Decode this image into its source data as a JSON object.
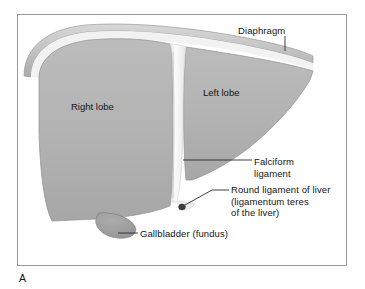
{
  "figure": {
    "panel_letter": "A",
    "title_alt": "Anterior view of the liver",
    "frame": {
      "x": 17,
      "y": 14,
      "width": 330,
      "height": 252,
      "border_color": "#9a9a9a",
      "background": "#ffffff"
    }
  },
  "colors": {
    "page_background": "#ffffff",
    "liver_parenchyma": "#b0b0b0",
    "liver_parenchyma_light": "#bdbdbd",
    "liver_outline": "#8a8a8a",
    "diaphragm_band": "#c9c9c9",
    "diaphragm_band_dark": "#a9a9a9",
    "diaphragm_highlight": "#efefef",
    "falciform_ligament": "#f4f4f4",
    "falciform_shadow": "#d8d8d8",
    "round_ligament": "#3d3d3d",
    "gallbladder": "#9e9e9e",
    "gallbladder_outline": "#7d7d7d",
    "leader_line": "#2b2b2b",
    "text": "#141414"
  },
  "annotations": [
    {
      "id": "diaphragm",
      "label": "Diaphragm",
      "lines": [
        "Diaphragm"
      ],
      "leader": "vertical",
      "target": "superior diaphragmatic band"
    },
    {
      "id": "falciform-ligament",
      "label": "Falciform ligament",
      "lines": [
        "Falciform",
        "ligament"
      ],
      "leader": "horizontal",
      "target": "interlobar falciform ligament"
    },
    {
      "id": "round-ligament",
      "label": "Round ligament of liver (ligamentum teres of the liver)",
      "lines": [
        "Round ligament of liver",
        "(ligamentum teres",
        "of the liver)"
      ],
      "leader": "angled",
      "target": "round ligament knob at free edge of falciform ligament"
    },
    {
      "id": "gallbladder",
      "label": "Gallbladder (fundus)",
      "lines": [
        "Gallbladder (fundus)"
      ],
      "leader": "horizontal",
      "target": "gallbladder fundus at inferior border"
    }
  ],
  "organ_labels": [
    {
      "id": "right-lobe",
      "label": "Right lobe"
    },
    {
      "id": "left-lobe",
      "label": "Left lobe"
    }
  ]
}
